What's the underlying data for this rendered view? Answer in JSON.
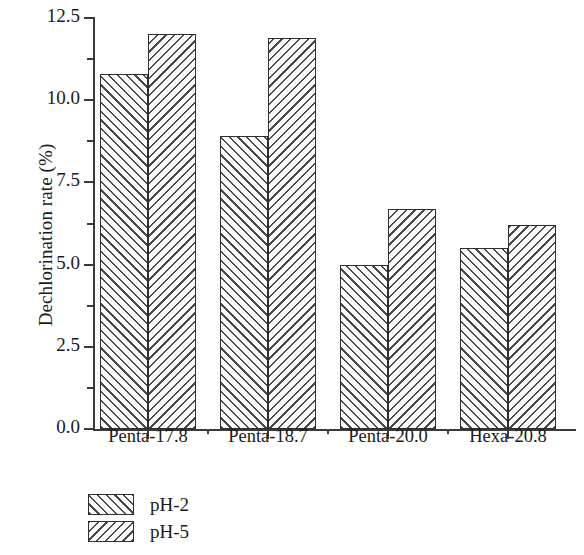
{
  "chart_data": {
    "type": "bar",
    "title": "",
    "xlabel": "",
    "ylabel": "Dechlorination rate (%)",
    "categories": [
      "Penta-17.8",
      "Penta-18.7",
      "Penta-20.0",
      "Hexa-20.8"
    ],
    "series": [
      {
        "name": "pH-2",
        "values": [
          10.8,
          8.9,
          5.0,
          5.5
        ],
        "hatch": "forward-diagonal"
      },
      {
        "name": "pH-5",
        "values": [
          12.0,
          11.9,
          6.7,
          6.2
        ],
        "hatch": "backward-diagonal"
      }
    ],
    "ylim": [
      0.0,
      12.5
    ],
    "ytick_labels": [
      "0.0",
      "2.5",
      "5.0",
      "7.5",
      "10.0",
      "12.5"
    ],
    "ytick_values": [
      0.0,
      2.5,
      5.0,
      7.5,
      10.0,
      12.5
    ],
    "yminor_values": [
      1.25,
      3.75,
      6.25,
      8.75,
      11.25
    ],
    "grid": false,
    "legend_position": "below-left",
    "colors": {
      "axis": "#3a3a3a",
      "bar_edge": "#2e2e2e",
      "hatch": "#4a4a4a",
      "background": "#ffffff",
      "text": "#1a1a1a"
    }
  }
}
